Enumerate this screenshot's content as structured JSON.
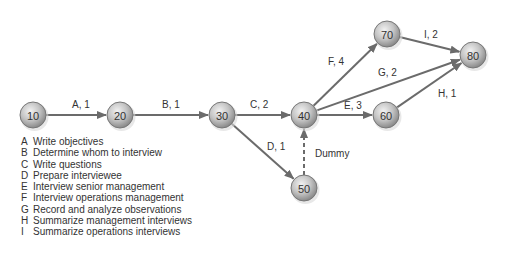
{
  "diagram": {
    "type": "activity-on-arrow network",
    "nodes": [
      {
        "id": "10",
        "x": 33,
        "y": 115
      },
      {
        "id": "20",
        "x": 120,
        "y": 115
      },
      {
        "id": "30",
        "x": 222,
        "y": 115
      },
      {
        "id": "40",
        "x": 304,
        "y": 115
      },
      {
        "id": "50",
        "x": 304,
        "y": 188
      },
      {
        "id": "60",
        "x": 386,
        "y": 115
      },
      {
        "id": "70",
        "x": 387,
        "y": 34
      },
      {
        "id": "80",
        "x": 473,
        "y": 55
      }
    ],
    "edges": [
      {
        "from": "10",
        "to": "20",
        "label": "A, 1",
        "lx": 72,
        "ly": 108
      },
      {
        "from": "20",
        "to": "30",
        "label": "B, 1",
        "lx": 162,
        "ly": 108
      },
      {
        "from": "30",
        "to": "40",
        "label": "C, 2",
        "lx": 250,
        "ly": 108
      },
      {
        "from": "30",
        "to": "50",
        "label": "D, 1",
        "lx": 267,
        "ly": 150
      },
      {
        "from": "40",
        "to": "60",
        "label": "E, 3",
        "lx": 344,
        "ly": 109
      },
      {
        "from": "40",
        "to": "70",
        "label": "F, 4",
        "lx": 328,
        "ly": 65
      },
      {
        "from": "40",
        "to": "80",
        "label": "G, 2",
        "lx": 378,
        "ly": 76
      },
      {
        "from": "60",
        "to": "80",
        "label": "H, 1",
        "lx": 438,
        "ly": 97
      },
      {
        "from": "70",
        "to": "80",
        "label": "I, 2",
        "lx": 424,
        "ly": 38
      },
      {
        "from": "50",
        "to": "40",
        "label": "Dummy",
        "lx": 315,
        "ly": 157,
        "dashed": true
      }
    ],
    "colors": {
      "edge": "#6b6b6b",
      "node_fill": "#bdbdbd",
      "node_stroke": "#777777"
    }
  },
  "legend": [
    {
      "key": "A",
      "text": "Write objectives"
    },
    {
      "key": "B",
      "text": "Determine whom to interview"
    },
    {
      "key": "C",
      "text": "Write questions"
    },
    {
      "key": "D",
      "text": "Prepare interviewee"
    },
    {
      "key": "E",
      "text": "Interview senior management"
    },
    {
      "key": "F",
      "text": "Interview operations management"
    },
    {
      "key": "G",
      "text": "Record and analyze observations"
    },
    {
      "key": "H",
      "text": "Summarize management interviews"
    },
    {
      "key": "I",
      "text": "Summarize operations interviews"
    }
  ]
}
